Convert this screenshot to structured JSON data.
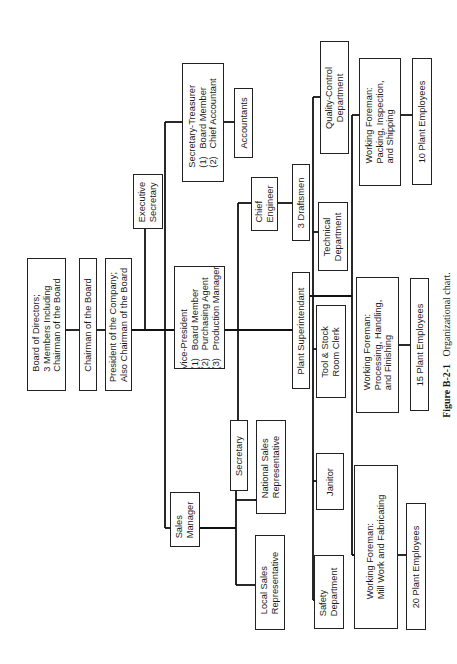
{
  "chart": {
    "orientation": "rotated-90-ccw",
    "nodes": {
      "board": "Board of Directors;\n3 Members Including\nChairman of the Board",
      "chairman": "Chairman of the Board",
      "president": "President of the Company;\nAlso Chairman of the Board",
      "exec_secretary": "Executive\nSecretary",
      "sec_treasurer": "Secretary-Treasurer\n(1)   Board Member\n(2)   Chief Accountant",
      "accountants": "Accountants",
      "vice_president": "Vice-President\n(1)   Board Member\n(2)   Purchasing Agent\n(3)   Production Manager",
      "chief_engineer": "Chief\nEngineer",
      "draftsmen": "3 Draftsmen",
      "technical_dept": "Technical\nDepartment",
      "quality_control": "Quality-Control\nDepartment",
      "foreman_packing": "Working Foreman:\nPacking, Inspection,\nand Shipping",
      "emp_10": "10 Plant Employees",
      "plant_super": "Plant Superintendant",
      "tool_stock": "Tool & Stock\nRoom Clerk",
      "foreman_processing": "Working Foreman:\nProcessing, Handling,\nand Finishing",
      "emp_15": "15 Plant Employees",
      "janitor": "Janitor",
      "safety_dept": "Safety\nDepartment",
      "foreman_mill": "Working Foreman:\nMill Work and Fabricating",
      "emp_20": "20 Plant Employees",
      "sales_manager": "Sales\nManager",
      "secretary": "Secretary",
      "national_sales": "National Sales\nRepresentative",
      "local_sales": "Local Sales\nRepresentative"
    },
    "caption": {
      "label": "Figure B-2-1",
      "text": "Organizational chart."
    }
  }
}
